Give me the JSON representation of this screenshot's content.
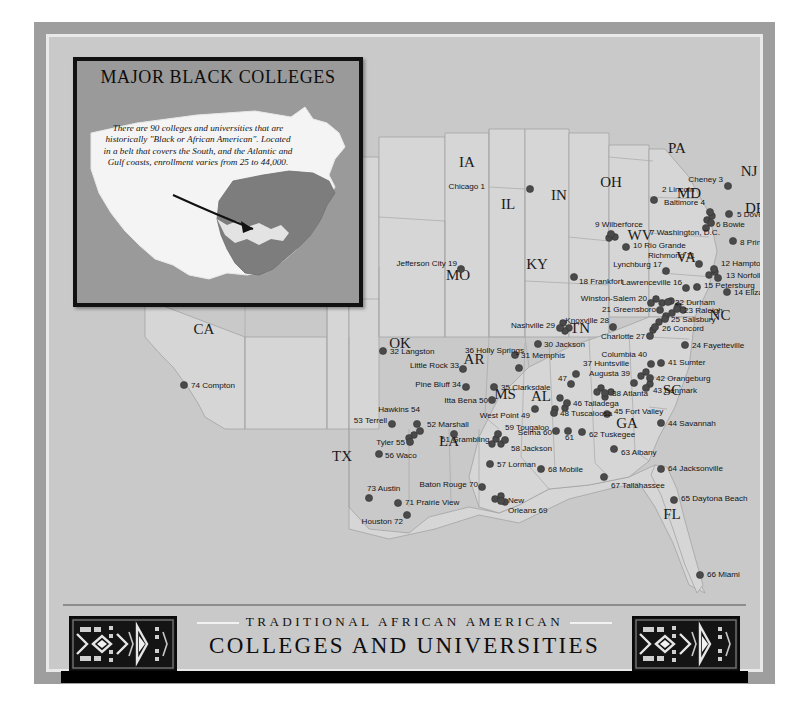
{
  "inset": {
    "title": "MAJOR BLACK COLLEGES",
    "caption": "There are 90 colleges and universities that are historically \"Black or African American\". Located in a belt that covers the South, and the Atlantic and Gulf coasts, enrollment varies from 25 to 44,000.",
    "highlight_color": "#7d7d7d",
    "land_color": "#f4f4f4",
    "background_color": "#9a9a9a"
  },
  "banner": {
    "line1": "TRADITIONAL AFRICAN AMERICAN",
    "line2": "COLLEGES AND UNIVERSITIES",
    "ornament_left": "kente-panel",
    "ornament_right": "kente-panel"
  },
  "map": {
    "land_color": "#d6d6d6",
    "water_color": "#c9c9c9",
    "dot_color": "#4a4a4a",
    "state_abbreviations": [
      {
        "text": "IA",
        "x": 418,
        "y": 130,
        "size": 15
      },
      {
        "text": "IL",
        "x": 459,
        "y": 172,
        "size": 15
      },
      {
        "text": "IN",
        "x": 510,
        "y": 163,
        "size": 15
      },
      {
        "text": "OH",
        "x": 562,
        "y": 150,
        "size": 15
      },
      {
        "text": "PA",
        "x": 628,
        "y": 116,
        "size": 15
      },
      {
        "text": "NJ",
        "x": 700,
        "y": 139,
        "size": 15
      },
      {
        "text": "MD",
        "x": 640,
        "y": 161,
        "size": 15
      },
      {
        "text": "DE",
        "x": 706,
        "y": 176,
        "size": 15
      },
      {
        "text": "MO",
        "x": 409,
        "y": 243,
        "size": 15
      },
      {
        "text": "KY",
        "x": 488,
        "y": 232,
        "size": 15
      },
      {
        "text": "WV",
        "x": 591,
        "y": 203,
        "size": 15
      },
      {
        "text": "VA",
        "x": 637,
        "y": 225,
        "size": 15
      },
      {
        "text": "NC",
        "x": 671,
        "y": 283,
        "size": 15
      },
      {
        "text": "TN",
        "x": 531,
        "y": 296,
        "size": 15
      },
      {
        "text": "OK",
        "x": 351,
        "y": 311,
        "size": 15
      },
      {
        "text": "AR",
        "x": 425,
        "y": 327,
        "size": 15
      },
      {
        "text": "MS",
        "x": 456,
        "y": 362,
        "size": 15
      },
      {
        "text": "AL",
        "x": 492,
        "y": 364,
        "size": 15
      },
      {
        "text": "GA",
        "x": 578,
        "y": 391,
        "size": 15
      },
      {
        "text": "SC",
        "x": 623,
        "y": 358,
        "size": 15
      },
      {
        "text": "CA",
        "x": 155,
        "y": 297,
        "size": 15
      },
      {
        "text": "TX",
        "x": 293,
        "y": 424,
        "size": 15
      },
      {
        "text": "LA",
        "x": 400,
        "y": 409,
        "size": 15
      },
      {
        "text": "FL",
        "x": 623,
        "y": 482,
        "size": 15
      }
    ],
    "colleges": [
      {
        "n": 1,
        "label": "Chicago 1",
        "dx": 481,
        "dy": 152,
        "tx": 436,
        "ty": 152,
        "anchor": "end"
      },
      {
        "n": 2,
        "label": "2 Lincoln",
        "dx": 605,
        "dy": 163,
        "tx": 613,
        "ty": 155,
        "anchor": "start"
      },
      {
        "n": 3,
        "label": "Cheney 3",
        "dx": 679,
        "dy": 149,
        "tx": 674,
        "ty": 145,
        "anchor": "end"
      },
      {
        "n": 4,
        "label": "Baltimore 4",
        "dx": 661,
        "dy": 175,
        "tx": 656,
        "ty": 168,
        "anchor": "end"
      },
      {
        "n": 5,
        "label": "5 Dover",
        "dx": 680,
        "dy": 177,
        "tx": 688,
        "ty": 180,
        "anchor": "start"
      },
      {
        "n": 6,
        "label": "6 Bowie",
        "dx": 662,
        "dy": 186,
        "tx": 667,
        "ty": 190,
        "anchor": "start"
      },
      {
        "n": 7,
        "label": "7  Washington, D.C.",
        "dx": 657,
        "dy": 191,
        "tx": 601,
        "ty": 198,
        "anchor": "start"
      },
      {
        "n": 8,
        "label": "8 Princess Anne",
        "dx": 684,
        "dy": 204,
        "tx": 691,
        "ty": 208,
        "anchor": "start"
      },
      {
        "n": 9,
        "label": "9 Wilberforce",
        "dx": 562,
        "dy": 197,
        "tx": 546,
        "ty": 190,
        "anchor": "start"
      },
      {
        "n": 10,
        "label": "10 Rio Grande",
        "dx": 577,
        "dy": 210,
        "tx": 584,
        "ty": 211,
        "anchor": "start"
      },
      {
        "n": 11,
        "label": "Richmond 11",
        "dx": 650,
        "dy": 227,
        "tx": 646,
        "ty": 221,
        "anchor": "end"
      },
      {
        "n": 12,
        "label": "12 Hampton",
        "dx": 665,
        "dy": 232,
        "tx": 672,
        "ty": 229,
        "anchor": "start"
      },
      {
        "n": 13,
        "label": "13 Norfolk",
        "dx": 669,
        "dy": 241,
        "tx": 677,
        "ty": 241,
        "anchor": "start"
      },
      {
        "n": 14,
        "label": "14 Elizabeth City",
        "dx": 678,
        "dy": 255,
        "tx": 685,
        "ty": 258,
        "anchor": "start"
      },
      {
        "n": 15,
        "label": "15 Petersburg",
        "dx": 648,
        "dy": 250,
        "tx": 655,
        "ty": 251,
        "anchor": "start"
      },
      {
        "n": 16,
        "label": "Lawrenceville 16",
        "dx": 637,
        "dy": 251,
        "tx": 633,
        "ty": 248,
        "anchor": "end"
      },
      {
        "n": 17,
        "label": "Lynchburg 17",
        "dx": 617,
        "dy": 234,
        "tx": 613,
        "ty": 230,
        "anchor": "end"
      },
      {
        "n": 18,
        "label": "18 Frankfort",
        "dx": 525,
        "dy": 240,
        "tx": 530,
        "ty": 247,
        "anchor": "start"
      },
      {
        "n": 19,
        "label": "Jefferson City 19",
        "dx": 412,
        "dy": 232,
        "tx": 408,
        "ty": 229,
        "anchor": "end"
      },
      {
        "n": 20,
        "label": "Winston-Salem 20",
        "dx": 602,
        "dy": 266,
        "tx": 598,
        "ty": 264,
        "anchor": "end"
      },
      {
        "n": 21,
        "label": "21 Greensboro",
        "dx": 611,
        "dy": 273,
        "tx": 607,
        "ty": 275,
        "anchor": "end"
      },
      {
        "n": 22,
        "label": "22 Durham",
        "dx": 619,
        "dy": 265,
        "tx": 626,
        "ty": 268,
        "anchor": "start"
      },
      {
        "n": 23,
        "label": "23 Raleigh",
        "dx": 628,
        "dy": 272,
        "tx": 635,
        "ty": 276,
        "anchor": "start"
      },
      {
        "n": 24,
        "label": "24 Fayetteville",
        "dx": 636,
        "dy": 308,
        "tx": 643,
        "ty": 311,
        "anchor": "start"
      },
      {
        "n": 25,
        "label": "25 Salisbury",
        "dx": 616,
        "dy": 282,
        "tx": 622,
        "ty": 285,
        "anchor": "start"
      },
      {
        "n": 26,
        "label": "26 Concord",
        "dx": 606,
        "dy": 290,
        "tx": 613,
        "ty": 294,
        "anchor": "start"
      },
      {
        "n": 27,
        "label": "Charlotte 27",
        "dx": 601,
        "dy": 299,
        "tx": 596,
        "ty": 302,
        "anchor": "end"
      },
      {
        "n": 28,
        "label": "Knoxville 28",
        "dx": 564,
        "dy": 290,
        "tx": 560,
        "ty": 286,
        "anchor": "end"
      },
      {
        "n": 29,
        "label": "Nashville 29",
        "dx": 511,
        "dy": 291,
        "tx": 506,
        "ty": 291,
        "anchor": "end"
      },
      {
        "n": 30,
        "label": "30 Jackson",
        "dx": 489,
        "dy": 307,
        "tx": 495,
        "ty": 310,
        "anchor": "start"
      },
      {
        "n": 31,
        "label": "31 Memphis",
        "dx": 466,
        "dy": 318,
        "tx": 472,
        "ty": 321,
        "anchor": "start"
      },
      {
        "n": 32,
        "label": "32 Langston",
        "dx": 334,
        "dy": 314,
        "tx": 341,
        "ty": 317,
        "anchor": "start"
      },
      {
        "n": 33,
        "label": "Little Rock 33",
        "dx": 414,
        "dy": 332,
        "tx": 410,
        "ty": 331,
        "anchor": "end"
      },
      {
        "n": 34,
        "label": "Pine Bluff 34",
        "dx": 417,
        "dy": 350,
        "tx": 412,
        "ty": 350,
        "anchor": "end"
      },
      {
        "n": 35,
        "label": "35 Clarksdale",
        "dx": 445,
        "dy": 350,
        "tx": 452,
        "ty": 353,
        "anchor": "start"
      },
      {
        "n": 36,
        "label": "36 Holly Springs",
        "dx": 470,
        "dy": 331,
        "tx": 416,
        "ty": 316,
        "anchor": "start"
      },
      {
        "n": 37,
        "label": "37 Huntsville",
        "dx": 527,
        "dy": 337,
        "tx": 534,
        "ty": 329,
        "anchor": "start"
      },
      {
        "n": 38,
        "label": "38 Atlanta",
        "dx": 556,
        "dy": 356,
        "tx": 563,
        "ty": 359,
        "anchor": "start"
      },
      {
        "n": 39,
        "label": "Augusta 39",
        "dx": 585,
        "dy": 346,
        "tx": 581,
        "ty": 339,
        "anchor": "end"
      },
      {
        "n": 40,
        "label": "Columbia 40",
        "dx": 602,
        "dy": 327,
        "tx": 598,
        "ty": 320,
        "anchor": "end"
      },
      {
        "n": 41,
        "label": "41 Sumter",
        "dx": 612,
        "dy": 326,
        "tx": 619,
        "ty": 328,
        "anchor": "start"
      },
      {
        "n": 42,
        "label": "42 Orangeburg",
        "dx": 601,
        "dy": 341,
        "tx": 607,
        "ty": 344,
        "anchor": "start"
      },
      {
        "n": 43,
        "label": "43 Denmark",
        "dx": 597,
        "dy": 351,
        "tx": 604,
        "ty": 356,
        "anchor": "start"
      },
      {
        "n": 44,
        "label": "44 Savannah",
        "dx": 612,
        "dy": 386,
        "tx": 619,
        "ty": 389,
        "anchor": "start"
      },
      {
        "n": 45,
        "label": "45 Fort Valley",
        "dx": 558,
        "dy": 377,
        "tx": 565,
        "ty": 377,
        "anchor": "start"
      },
      {
        "n": 46,
        "label": "46 Talladega",
        "dx": 518,
        "dy": 366,
        "tx": 524,
        "ty": 369,
        "anchor": "start"
      },
      {
        "n": 47,
        "label": "47",
        "dx": 522,
        "dy": 347,
        "tx": 509,
        "ty": 344,
        "anchor": "start"
      },
      {
        "n": 48,
        "label": "48 Tuscaloosa",
        "dx": 505,
        "dy": 376,
        "tx": 511,
        "ty": 379,
        "anchor": "start"
      },
      {
        "n": 49,
        "label": "West Point 49",
        "dx": 486,
        "dy": 372,
        "tx": 481,
        "ty": 381,
        "anchor": "end"
      },
      {
        "n": 50,
        "label": "Itta Bena 50",
        "dx": 443,
        "dy": 363,
        "tx": 439,
        "ty": 366,
        "anchor": "end"
      },
      {
        "n": 51,
        "label": "51 Grambling",
        "dx": 405,
        "dy": 397,
        "tx": 392,
        "ty": 405,
        "anchor": "start"
      },
      {
        "n": 52,
        "label": "52 Marshall",
        "dx": 371,
        "dy": 394,
        "tx": 378,
        "ty": 390,
        "anchor": "start"
      },
      {
        "n": 53,
        "label": "53 Terrell",
        "dx": 343,
        "dy": 387,
        "tx": 338,
        "ty": 386,
        "anchor": "end"
      },
      {
        "n": 54,
        "label": "Hawkins 54",
        "dx": 368,
        "dy": 387,
        "tx": 371,
        "ty": 375,
        "anchor": "end"
      },
      {
        "n": 55,
        "label": "Tyler 55",
        "dx": 361,
        "dy": 405,
        "tx": 356,
        "ty": 408,
        "anchor": "end"
      },
      {
        "n": 56,
        "label": "56 Waco",
        "dx": 330,
        "dy": 417,
        "tx": 336,
        "ty": 421,
        "anchor": "start"
      },
      {
        "n": 57,
        "label": "57 Lorman",
        "dx": 441,
        "dy": 427,
        "tx": 448,
        "ty": 430,
        "anchor": "start"
      },
      {
        "n": 58,
        "label": "58 Jackson",
        "dx": 456,
        "dy": 403,
        "tx": 462,
        "ty": 414,
        "anchor": "start"
      },
      {
        "n": 59,
        "label": "59 Tougaloo",
        "dx": 449,
        "dy": 397,
        "tx": 456,
        "ty": 393,
        "anchor": "start"
      },
      {
        "n": 60,
        "label": "Selma 60",
        "dx": 507,
        "dy": 394,
        "tx": 503,
        "ty": 398,
        "anchor": "end"
      },
      {
        "n": 61,
        "label": "61",
        "dx": 519,
        "dy": 394,
        "tx": 516,
        "ty": 403,
        "anchor": "start"
      },
      {
        "n": 62,
        "label": "62 Tuskegee",
        "dx": 533,
        "dy": 395,
        "tx": 540,
        "ty": 400,
        "anchor": "start"
      },
      {
        "n": 63,
        "label": "63 Albany",
        "dx": 565,
        "dy": 412,
        "tx": 572,
        "ty": 418,
        "anchor": "start"
      },
      {
        "n": 64,
        "label": "64 Jacksonville",
        "dx": 612,
        "dy": 432,
        "tx": 619,
        "ty": 434,
        "anchor": "start"
      },
      {
        "n": 65,
        "label": "65 Daytona Beach",
        "dx": 625,
        "dy": 463,
        "tx": 632,
        "ty": 464,
        "anchor": "start"
      },
      {
        "n": 66,
        "label": "66 Miami",
        "dx": 651,
        "dy": 538,
        "tx": 658,
        "ty": 540,
        "anchor": "start"
      },
      {
        "n": 67,
        "label": "67 Tallahassee",
        "dx": 555,
        "dy": 440,
        "tx": 562,
        "ty": 451,
        "anchor": "start"
      },
      {
        "n": 68,
        "label": "68 Mobile",
        "dx": 492,
        "dy": 432,
        "tx": 499,
        "ty": 435,
        "anchor": "start"
      },
      {
        "n": 69,
        "label": "New\nOrleans 69",
        "dx": 452,
        "dy": 464,
        "tx": 459,
        "ty": 466,
        "anchor": "start"
      },
      {
        "n": 70,
        "label": "Baton Rouge 70",
        "dx": 433,
        "dy": 450,
        "tx": 429,
        "ty": 450,
        "anchor": "end"
      },
      {
        "n": 71,
        "label": "71 Prairie View",
        "dx": 349,
        "dy": 466,
        "tx": 356,
        "ty": 468,
        "anchor": "start"
      },
      {
        "n": 72,
        "label": "Houston 72",
        "dx": 358,
        "dy": 478,
        "tx": 354,
        "ty": 487,
        "anchor": "end"
      },
      {
        "n": 73,
        "label": "73 Austin",
        "dx": 320,
        "dy": 461,
        "tx": 318,
        "ty": 454,
        "anchor": "start"
      },
      {
        "n": 74,
        "label": "74 Compton",
        "dx": 135,
        "dy": 348,
        "tx": 142,
        "ty": 351,
        "anchor": "start"
      }
    ],
    "cluster_dots": [
      {
        "x": 514,
        "y": 286
      },
      {
        "x": 520,
        "y": 291
      },
      {
        "x": 516,
        "y": 294
      },
      {
        "x": 607,
        "y": 262
      },
      {
        "x": 613,
        "y": 266
      },
      {
        "x": 622,
        "y": 264
      },
      {
        "x": 629,
        "y": 269
      },
      {
        "x": 634,
        "y": 273
      },
      {
        "x": 623,
        "y": 276
      },
      {
        "x": 617,
        "y": 279
      },
      {
        "x": 610,
        "y": 285
      },
      {
        "x": 604,
        "y": 293
      },
      {
        "x": 552,
        "y": 351
      },
      {
        "x": 548,
        "y": 355
      },
      {
        "x": 556,
        "y": 360
      },
      {
        "x": 562,
        "y": 355
      },
      {
        "x": 597,
        "y": 335
      },
      {
        "x": 592,
        "y": 339
      },
      {
        "x": 601,
        "y": 347
      },
      {
        "x": 447,
        "y": 402
      },
      {
        "x": 452,
        "y": 407
      },
      {
        "x": 443,
        "y": 407
      },
      {
        "x": 446,
        "y": 462
      },
      {
        "x": 452,
        "y": 459
      },
      {
        "x": 456,
        "y": 465
      },
      {
        "x": 660,
        "y": 238
      },
      {
        "x": 666,
        "y": 235
      },
      {
        "x": 658,
        "y": 183
      },
      {
        "x": 663,
        "y": 179
      },
      {
        "x": 566,
        "y": 200
      },
      {
        "x": 560,
        "y": 201
      },
      {
        "x": 511,
        "y": 361
      },
      {
        "x": 506,
        "y": 372
      },
      {
        "x": 516,
        "y": 371
      },
      {
        "x": 365,
        "y": 398
      },
      {
        "x": 360,
        "y": 401
      }
    ]
  }
}
